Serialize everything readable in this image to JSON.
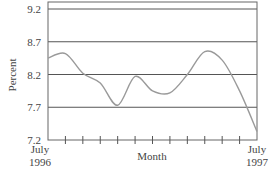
{
  "chart_data": {
    "type": "line",
    "title": "",
    "xlabel": "Month",
    "ylabel": "Percent",
    "ylim": [
      7.2,
      9.2
    ],
    "yticks": [
      7.2,
      7.7,
      8.2,
      8.7,
      9.2
    ],
    "ytick_labels": [
      "7.2",
      "7.7",
      "8.2",
      "8.7",
      "9.2"
    ],
    "grid": "horizontal",
    "legend": "none",
    "x_start_label": [
      "July",
      "1996"
    ],
    "x_end_label": [
      "July",
      "1997"
    ],
    "categories": [
      "Jul 1996",
      "Aug 1996",
      "Sep 1996",
      "Oct 1996",
      "Nov 1996",
      "Dec 1996",
      "Jan 1997",
      "Feb 1997",
      "Mar 1997",
      "Apr 1997",
      "May 1997",
      "Jun 1997",
      "Jul 1997"
    ],
    "series": [
      {
        "name": "Percent",
        "values": [
          8.45,
          8.52,
          8.22,
          8.07,
          7.73,
          8.17,
          7.95,
          7.92,
          8.2,
          8.55,
          8.42,
          7.95,
          7.33
        ]
      }
    ],
    "colors": {
      "line": "#9a9a9a",
      "grid": "#555555",
      "axis": "#555555"
    }
  }
}
